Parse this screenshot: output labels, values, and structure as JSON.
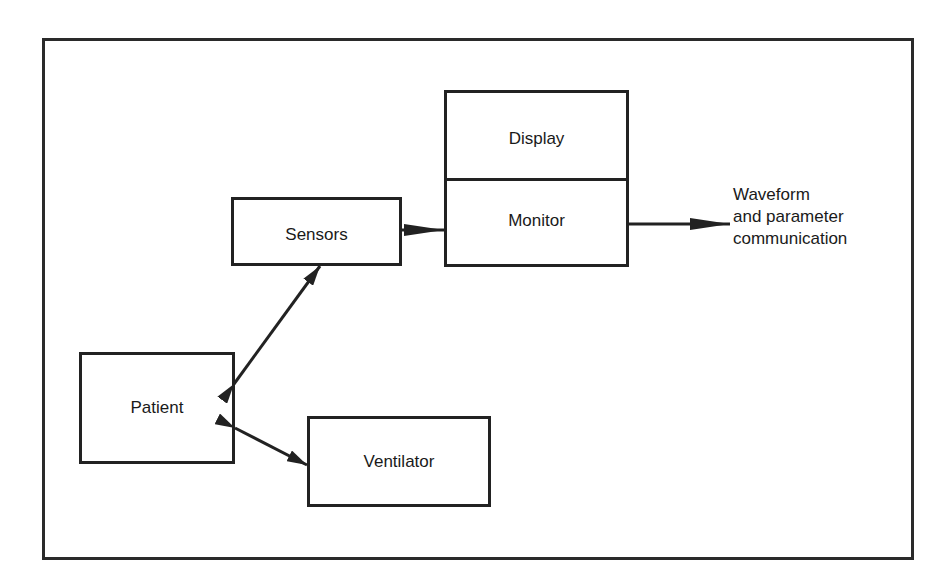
{
  "diagram": {
    "nodes": {
      "display": "Display",
      "monitor": "Monitor",
      "sensors": "Sensors",
      "patient": "Patient",
      "ventilator": "Ventilator"
    },
    "output_label": {
      "line1": "Waveform",
      "line2": "and parameter",
      "line3": "communication"
    },
    "edges": [
      {
        "from": "sensors",
        "to": "monitor",
        "type": "one-way"
      },
      {
        "from": "monitor",
        "to": "output",
        "type": "one-way"
      },
      {
        "from": "patient",
        "to": "sensors",
        "type": "bidirectional"
      },
      {
        "from": "patient",
        "to": "ventilator",
        "type": "bidirectional"
      }
    ]
  }
}
